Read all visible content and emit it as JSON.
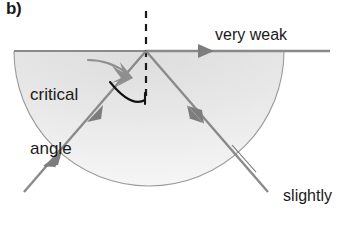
{
  "figure": {
    "panel_letter": "b)",
    "domain_note": "total internal reflection near the critical angle",
    "colors": {
      "ray": "#8a8a8a",
      "ray_dark": "#6f6f6f",
      "arc": "#111111",
      "text": "#1a1a1a",
      "medium_fill_top": "#e3e3e3",
      "medium_fill_bottom": "#f4f4f4",
      "medium_edge": "#9a9a9a",
      "background": "#ffffff"
    },
    "labels": {
      "critical_angle": {
        "line1": "critical",
        "line2": "angle"
      },
      "very_weak": "very weak",
      "reflected_ray": {
        "line1": "slightly",
        "line2": "stronger",
        "line3": "reflected ray"
      }
    },
    "icons": {
      "incident_ray_arrow": "arrowhead-icon",
      "refracted_ray_arrow": "arrowhead-icon",
      "reflected_ray_arrow": "arrowhead-icon",
      "callout_pointer": "curved-pointer-arrow-icon",
      "angle_arc": "angle-arc-icon",
      "normal_line": "dashed-normal-line-icon",
      "leader_line": "leader-line-icon"
    },
    "geometry": {
      "interface_point": {
        "x": 146,
        "y": 51
      },
      "semicircle": {
        "cx": 149,
        "cy": 51,
        "r": 135
      },
      "normal_line": {
        "x": 146,
        "y_top": 12,
        "y_bottom": 100
      },
      "interface_line": {
        "x1": 14,
        "x2": 330,
        "y": 51
      }
    }
  }
}
